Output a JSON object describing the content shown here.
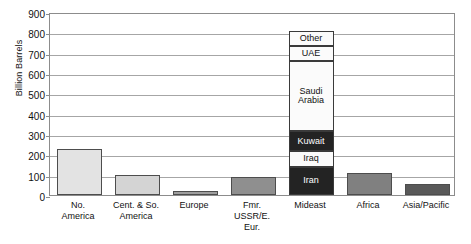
{
  "chart_data": {
    "type": "bar",
    "title": "",
    "xlabel": "",
    "ylabel": "Billion Barrels",
    "ylim": [
      0,
      900
    ],
    "yticks": [
      0,
      100,
      200,
      300,
      400,
      500,
      600,
      700,
      800,
      900
    ],
    "grid": true,
    "legend": false,
    "categories": [
      "No. America",
      "Cent. & So. America",
      "Europe",
      "Fmr. USSR/E. Eur.",
      "Mideast",
      "Africa",
      "Asia/Pacific"
    ],
    "values": [
      225,
      100,
      20,
      90,
      805,
      110,
      55
    ],
    "bar_colors": [
      "#e3e3e3",
      "#d4d4d4",
      "#9e9e9e",
      "#8f8f8f",
      "#232323",
      "#808080",
      "#595959"
    ],
    "stacked_bar": {
      "category": "Mideast",
      "total": 805,
      "segments": [
        {
          "label": "Iran",
          "value": 140,
          "from": 0,
          "to": 140,
          "fill": "dark"
        },
        {
          "label": "Iraq",
          "value": 75,
          "from": 140,
          "to": 215,
          "fill": "light"
        },
        {
          "label": "Kuwait",
          "value": 100,
          "from": 215,
          "to": 315,
          "fill": "dark"
        },
        {
          "label": "Saudi Arabia",
          "value": 345,
          "from": 315,
          "to": 660,
          "fill": "light"
        },
        {
          "label": "UAE",
          "value": 75,
          "from": 660,
          "to": 735,
          "fill": "light"
        },
        {
          "label": "Other",
          "value": 70,
          "from": 735,
          "to": 805,
          "fill": "light"
        }
      ]
    }
  },
  "axis": {
    "y_title": "Billion Barrels",
    "tick_labels": [
      "900",
      "800",
      "700",
      "600",
      "500",
      "400",
      "300",
      "200",
      "100",
      "0"
    ]
  },
  "category_labels": [
    "No.\nAmerica",
    "Cent. & So.\nAmerica",
    "Europe",
    "Fmr.\nUSSR/E.\nEur.",
    "Mideast",
    "Africa",
    "Asia/Pacific"
  ]
}
